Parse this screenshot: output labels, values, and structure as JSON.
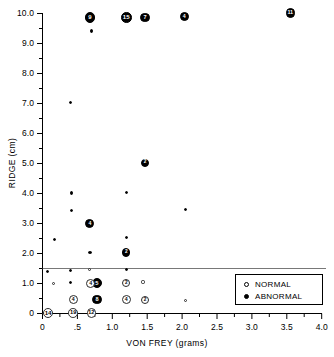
{
  "chart_data": {
    "type": "scatter",
    "title": "",
    "xlabel": "VON FREY (grams)",
    "ylabel": "RIDGE (cm)",
    "xlim": [
      0,
      4.0
    ],
    "ylim": [
      0,
      10.0
    ],
    "grid": false,
    "xticks": [
      "0",
      ".5",
      "1.0",
      "1.5",
      "2.0",
      "2.5",
      "3.0",
      "3.5",
      "4.0"
    ],
    "xtick_values": [
      0,
      0.5,
      1.0,
      1.5,
      2.0,
      2.5,
      3.0,
      3.5,
      4.0
    ],
    "yticks": [
      "0",
      "1.0",
      "2.0",
      "3.0",
      "4.0",
      "5.0",
      "6.0",
      "7.0",
      "8.0",
      "9.0",
      "10.0"
    ],
    "ytick_values": [
      0,
      1.0,
      2.0,
      3.0,
      4.0,
      5.0,
      6.0,
      7.0,
      8.0,
      9.0,
      10.0
    ],
    "reference_line": {
      "orientation": "horizontal",
      "y": 1.5
    },
    "legend": {
      "position": "lower-right",
      "entries": [
        {
          "label": "NORMAL",
          "marker": "open-circle"
        },
        {
          "label": "ABNORMAL",
          "marker": "filled-circle"
        }
      ]
    },
    "note": "Marker size encodes count; count printed inside large markers.",
    "series": [
      {
        "name": "ABNORMAL",
        "marker": "filled-circle",
        "points": [
          {
            "x": 0.68,
            "y": 9.85,
            "n": 9
          },
          {
            "x": 0.7,
            "y": 9.4,
            "n": 1
          },
          {
            "x": 1.2,
            "y": 9.85,
            "n": 15
          },
          {
            "x": 1.47,
            "y": 9.85,
            "n": 7
          },
          {
            "x": 2.03,
            "y": 9.88,
            "n": 4
          },
          {
            "x": 3.55,
            "y": 10.0,
            "n": 11
          },
          {
            "x": 0.4,
            "y": 7.02,
            "n": 1
          },
          {
            "x": 1.47,
            "y": 5.02,
            "n": 2
          },
          {
            "x": 0.41,
            "y": 4.01,
            "n": 1
          },
          {
            "x": 1.2,
            "y": 4.03,
            "n": 1
          },
          {
            "x": 0.41,
            "y": 3.42,
            "n": 1
          },
          {
            "x": 2.05,
            "y": 3.45,
            "n": 1
          },
          {
            "x": 0.68,
            "y": 3.0,
            "n": 4
          },
          {
            "x": 0.17,
            "y": 2.47,
            "n": 1
          },
          {
            "x": 1.2,
            "y": 2.52,
            "n": 1
          },
          {
            "x": 0.68,
            "y": 2.02,
            "n": 1
          },
          {
            "x": 1.2,
            "y": 2.03,
            "n": 2
          },
          {
            "x": 0.07,
            "y": 1.41,
            "n": 1
          },
          {
            "x": 0.4,
            "y": 1.42,
            "n": 1
          },
          {
            "x": 1.2,
            "y": 1.46,
            "n": 1
          },
          {
            "x": 0.4,
            "y": 1.03,
            "n": 1
          },
          {
            "x": 0.78,
            "y": 1.0,
            "n": 5
          },
          {
            "x": 0.74,
            "y": 0.45,
            "n": 1
          },
          {
            "x": 0.78,
            "y": 0.46,
            "n": 8
          }
        ]
      },
      {
        "name": "NORMAL",
        "marker": "open-circle",
        "points": [
          {
            "x": 0.67,
            "y": 1.47,
            "n": 1
          },
          {
            "x": 0.16,
            "y": 1.0,
            "n": 1
          },
          {
            "x": 0.69,
            "y": 1.0,
            "n": 4
          },
          {
            "x": 1.2,
            "y": 1.01,
            "n": 2
          },
          {
            "x": 1.44,
            "y": 1.05,
            "n": 1
          },
          {
            "x": 0.44,
            "y": 0.45,
            "n": 4
          },
          {
            "x": 1.2,
            "y": 0.45,
            "n": 4
          },
          {
            "x": 1.47,
            "y": 0.45,
            "n": 2
          },
          {
            "x": 2.05,
            "y": 0.44,
            "n": 1
          },
          {
            "x": 0.08,
            "y": 0.02,
            "n": 14
          },
          {
            "x": 0.44,
            "y": 0.02,
            "n": 19
          },
          {
            "x": 0.7,
            "y": 0.02,
            "n": 12
          }
        ]
      }
    ]
  },
  "axes": {
    "x_title": "VON FREY (grams)",
    "y_title": "RIDGE (cm)"
  },
  "legend": {
    "normal_label": "NORMAL",
    "abnormal_label": "ABNORMAL"
  }
}
